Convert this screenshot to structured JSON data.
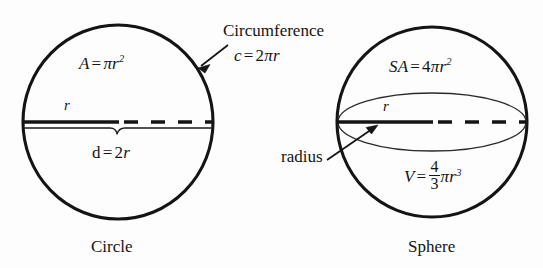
{
  "figure": {
    "background_color": "#fdfdfd",
    "ink_color": "#141414"
  },
  "circle": {
    "caption": "Circle",
    "area_formula": {
      "lhs": "A",
      "equals": "=",
      "pi": "π",
      "radius_var": "r",
      "exponent": "2",
      "plain": "A = πr²"
    },
    "radius_label": "r",
    "diameter_formula": {
      "lhs": "d",
      "equals": "=",
      "coefficient": "2",
      "radius_var": "r",
      "plain": "d = 2r"
    },
    "circumference_label": "Circumference",
    "circumference_formula": {
      "lhs": "c",
      "equals": "=",
      "coefficient": "2",
      "pi": "π",
      "radius_var": "r",
      "plain": "c = 2πr"
    },
    "geometry": {
      "center_x": 118,
      "center_y": 122,
      "radius_x": 95,
      "radius_y": 97,
      "diameter_line_y": 122,
      "solid_radius_from_x": 24,
      "solid_radius_to_x": 118
    }
  },
  "sphere": {
    "caption": "Sphere",
    "surface_area_formula": {
      "lhs": "SA",
      "equals": "=",
      "coefficient": "4",
      "pi": "π",
      "radius_var": "r",
      "exponent": "2",
      "plain": "SA = 4πr²"
    },
    "radius_label": "r",
    "radius_callout": "radius",
    "volume_formula": {
      "lhs": "V",
      "equals": "=",
      "numerator": "4",
      "denominator": "3",
      "pi": "π",
      "radius_var": "r",
      "exponent": "3",
      "plain": "V = 4πr³/3"
    },
    "geometry": {
      "center_x": 432,
      "center_y": 122,
      "radius_x": 95,
      "radius_y": 95,
      "equator_ry": 29,
      "diameter_line_y": 122,
      "solid_radius_from_x": 337,
      "solid_radius_to_x": 432
    }
  }
}
